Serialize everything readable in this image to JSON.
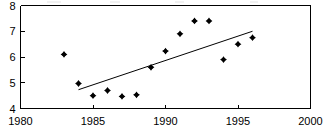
{
  "figure": {
    "name": "scatter-with-trend-line",
    "background_color": "#ffffff",
    "foreground_color": "#000000"
  },
  "chart_data": {
    "type": "scatter",
    "title": "",
    "subtitle": "",
    "xlabel": "",
    "ylabel": "",
    "xlim": [
      1980,
      2000
    ],
    "ylim": [
      4,
      8
    ],
    "xticks": [
      1980,
      1985,
      1990,
      1995,
      2000
    ],
    "yticks": [
      4,
      5,
      6,
      7,
      8
    ],
    "xtick_labels": [
      "1980",
      "1985",
      "1990",
      "1995",
      "2000"
    ],
    "ytick_labels": [
      "4",
      "5",
      "6",
      "7",
      "8"
    ],
    "grid": false,
    "legend": null,
    "marker": "diamond",
    "marker_color": "#000000",
    "series": [
      {
        "name": "observations",
        "x": [
          1983,
          1984,
          1985,
          1986,
          1987,
          1988,
          1989,
          1990,
          1991,
          1992,
          1993,
          1994,
          1995,
          1996
        ],
        "values": [
          6.1,
          4.97,
          4.5,
          4.7,
          4.47,
          4.53,
          5.6,
          6.23,
          6.9,
          7.4,
          7.4,
          5.9,
          6.5,
          6.75
        ]
      }
    ],
    "trend_line": {
      "name": "linear-fit",
      "x": [
        1984.0,
        1996.0
      ],
      "y": [
        4.73,
        7.0
      ],
      "color": "#000000"
    },
    "annotations": []
  }
}
